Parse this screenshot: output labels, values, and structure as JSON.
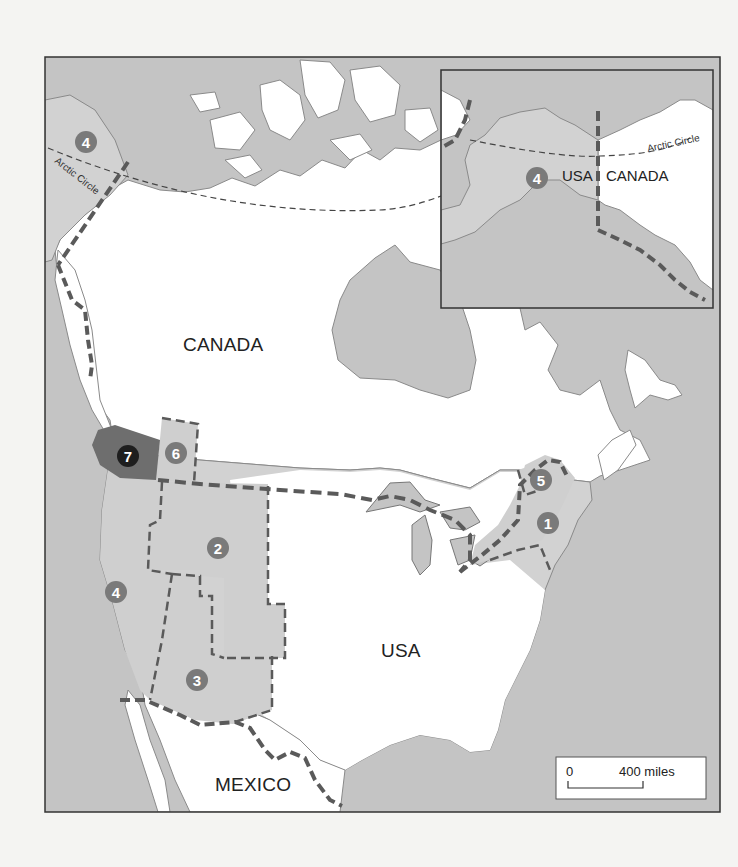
{
  "map": {
    "title_labels": {
      "canada": "CANADA",
      "usa": "USA",
      "mexico": "MEXICO",
      "arctic_circle": "Arctic Circle"
    },
    "inset": {
      "usa": "USA",
      "canada": "CANADA",
      "arctic_circle": "Arctic Circle",
      "marker": "4"
    },
    "markers": [
      {
        "id": "1",
        "label": "1",
        "style": "gray"
      },
      {
        "id": "2",
        "label": "2",
        "style": "gray"
      },
      {
        "id": "3",
        "label": "3",
        "style": "gray"
      },
      {
        "id": "4",
        "label": "4",
        "style": "gray"
      },
      {
        "id": "4b",
        "label": "4",
        "style": "gray"
      },
      {
        "id": "5",
        "label": "5",
        "style": "gray"
      },
      {
        "id": "6",
        "label": "6",
        "style": "gray"
      },
      {
        "id": "7",
        "label": "7",
        "style": "dark"
      }
    ],
    "scale": {
      "start": "0",
      "end": "400 miles"
    },
    "colors": {
      "water": "#c4c4c4",
      "land": "#ffffff",
      "usa_land": "#d2d2d2",
      "region_fill": "#cfcfcf",
      "region7_fill": "#6e6e6e",
      "border": "#555555",
      "marker_gray": "#7a7a7a",
      "marker_dark": "#1e1e1e"
    }
  }
}
